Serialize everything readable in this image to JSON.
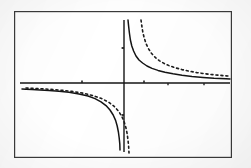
{
  "figure": {
    "name": "hyperbola-graph",
    "caption": "",
    "background_color": "#fdfdfd",
    "ink_color": "#1a1a1a",
    "frame": {
      "label": "plot-border",
      "x": 14,
      "y": 11,
      "width": 218,
      "height": 147,
      "stroke_color": "#3a3a3a",
      "stroke_width": 1.2
    }
  },
  "chart_data": {
    "type": "line",
    "title": "",
    "subtitle": "",
    "xlabel": "",
    "ylabel": "",
    "xlim": [
      -5.6,
      5.6
    ],
    "ylim": [
      -3.8,
      3.8
    ],
    "grid": false,
    "legend": null,
    "legend_position": "none",
    "axes": {
      "x_axis": {
        "name": "x-axis",
        "y_value": 0,
        "pixel_y": 83,
        "x_start_px": 20,
        "x_end_px": 230,
        "stroke_width": 1.3
      },
      "y_axis": {
        "name": "y-axis",
        "x_value": 0,
        "pixel_x": 124,
        "y_start_px": 20,
        "y_end_px": 152,
        "stroke_width": 1.3
      },
      "ticks": {
        "x_ticks_px": [
          82,
          144,
          168,
          204
        ],
        "y_ticks_px": [
          48,
          115
        ],
        "tick_length": 4
      }
    },
    "series": [
      {
        "name": "solid-curve",
        "label": "",
        "style": "solid",
        "stroke_color": "#141414",
        "stroke_width": 1.5,
        "function": "y = k/x",
        "k": 1.0,
        "branches": [
          {
            "name": "upper-right-branch",
            "points_px": [
              [
                128,
                20
              ],
              [
                128.6,
                26
              ],
              [
                129.4,
                33
              ],
              [
                130.4,
                40
              ],
              [
                131.8,
                46
              ],
              [
                133.6,
                51
              ],
              [
                136.0,
                56
              ],
              [
                139.0,
                60
              ],
              [
                142.6,
                63
              ],
              [
                147.0,
                66
              ],
              [
                152.0,
                68.4
              ],
              [
                158.0,
                70.4
              ],
              [
                165.0,
                72.2
              ],
              [
                173.0,
                73.8
              ],
              [
                182.0,
                75.2
              ],
              [
                192.0,
                76.4
              ],
              [
                203.0,
                77.4
              ],
              [
                214.0,
                78.2
              ],
              [
                226.0,
                78.8
              ],
              [
                230.0,
                79.0
              ]
            ]
          },
          {
            "name": "lower-left-branch",
            "points_px": [
              [
                22,
                89
              ],
              [
                26,
                89.2
              ],
              [
                32,
                89.5
              ],
              [
                40,
                89.9
              ],
              [
                49,
                90.4
              ],
              [
                59,
                91.2
              ],
              [
                69,
                92.3
              ],
              [
                79,
                93.9
              ],
              [
                88,
                96.0
              ],
              [
                95,
                98.6
              ],
              [
                101,
                101.8
              ],
              [
                106,
                105.6
              ],
              [
                110,
                110.0
              ],
              [
                113.2,
                115.0
              ],
              [
                115.6,
                120.4
              ],
              [
                117.2,
                126.0
              ],
              [
                118.4,
                132.0
              ],
              [
                119.2,
                138.0
              ],
              [
                119.8,
                144.0
              ],
              [
                120.0,
                150.0
              ]
            ]
          }
        ]
      },
      {
        "name": "dashed-curve",
        "label": "",
        "style": "dashed",
        "dash_pattern": "2 3",
        "stroke_color": "#1c1c1c",
        "stroke_width": 1.6,
        "function": "y = k/x",
        "k": 1.8,
        "branches": [
          {
            "name": "upper-right-branch",
            "points_px": [
              [
                141,
                20
              ],
              [
                141.8,
                26
              ],
              [
                142.8,
                32
              ],
              [
                144.2,
                38
              ],
              [
                146.0,
                43.5
              ],
              [
                148.4,
                48.6
              ],
              [
                151.4,
                53.2
              ],
              [
                155.0,
                57.2
              ],
              [
                159.2,
                60.6
              ],
              [
                164.0,
                63.4
              ],
              [
                169.4,
                65.8
              ],
              [
                175.4,
                67.8
              ],
              [
                182.0,
                69.6
              ],
              [
                189.2,
                71.2
              ],
              [
                197.0,
                72.6
              ],
              [
                205.4,
                73.8
              ],
              [
                214.2,
                74.8
              ],
              [
                223.0,
                75.6
              ],
              [
                230.0,
                76.2
              ]
            ]
          },
          {
            "name": "lower-left-branch",
            "points_px": [
              [
                26,
                88
              ],
              [
                32,
                88.3
              ],
              [
                40,
                88.7
              ],
              [
                50,
                89.3
              ],
              [
                61,
                90.2
              ],
              [
                72,
                91.4
              ],
              [
                83,
                93.2
              ],
              [
                93,
                95.6
              ],
              [
                101.6,
                98.6
              ],
              [
                108.6,
                102.2
              ],
              [
                114.2,
                106.4
              ],
              [
                118.6,
                111.2
              ],
              [
                121.8,
                116.4
              ],
              [
                124.2,
                122.0
              ],
              [
                126.0,
                128.0
              ],
              [
                127.2,
                134.0
              ],
              [
                128.0,
                140.0
              ],
              [
                128.6,
                146.0
              ],
              [
                129.0,
                153.0
              ]
            ]
          }
        ]
      }
    ]
  }
}
